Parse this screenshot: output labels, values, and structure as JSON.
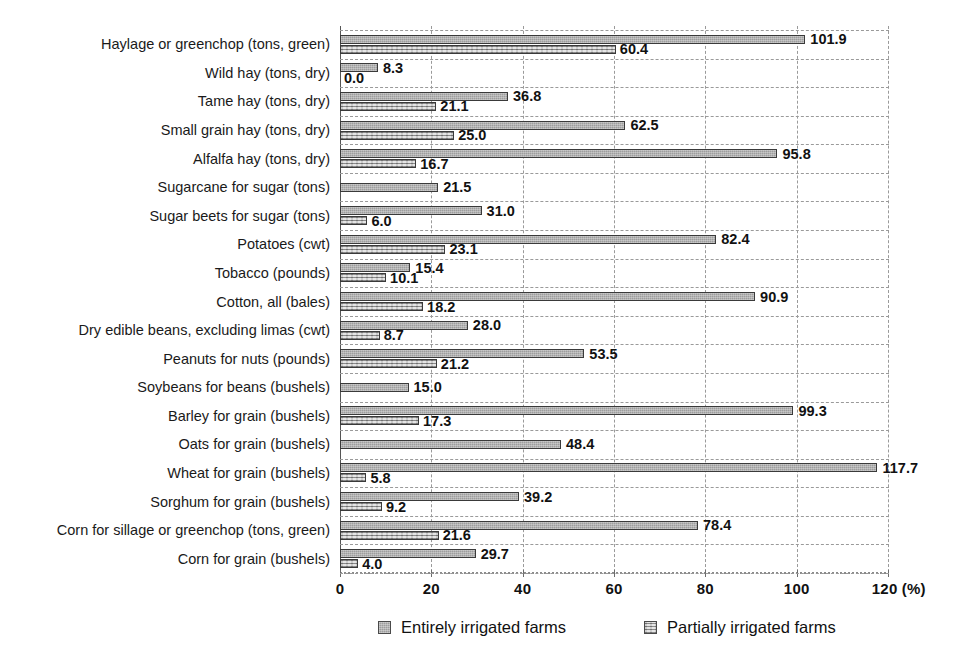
{
  "chart_data": {
    "type": "bar",
    "orientation": "horizontal",
    "title": "",
    "subtitle": "",
    "xlabel": "(%)",
    "ylabel": "",
    "xlim": [
      0,
      120
    ],
    "xticks": [
      0,
      20,
      40,
      60,
      80,
      100,
      120
    ],
    "xtick_labels": [
      "0",
      "20",
      "40",
      "60",
      "80",
      "100",
      "120"
    ],
    "x_unit_label": "120 (%)",
    "grid": "vertical-dashed-and-horizontal-dashed",
    "legend_position": "bottom",
    "legend": [
      "Entirely irrigated farms",
      "Partially irrigated farms"
    ],
    "colors": {
      "entirely": "#9d9d9d",
      "partially": "#b3b3b3",
      "bar_border": "#3a3a3a",
      "grid": "#9a9a9a",
      "axis": "#555555",
      "text": "#111111",
      "background": "#ffffff"
    },
    "categories": [
      "Haylage or greenchop (tons, green)",
      "Wild hay (tons, dry)",
      "Tame hay (tons, dry)",
      "Small grain hay (tons, dry)",
      "Alfalfa hay (tons, dry)",
      "Sugarcane for sugar (tons)",
      "Sugar beets for sugar (tons)",
      "Potatoes (cwt)",
      "Tobacco (pounds)",
      "Cotton, all (bales)",
      "Dry edible beans, excluding limas (cwt)",
      "Peanuts for nuts (pounds)",
      "Soybeans for beans (bushels)",
      "Barley for grain (bushels)",
      "Oats for grain (bushels)",
      "Wheat for grain (bushels)",
      "Sorghum for grain (bushels)",
      "Corn for sillage or greenchop (tons, green)",
      "Corn for grain (bushels)"
    ],
    "series": [
      {
        "name": "Entirely irrigated farms",
        "values": [
          101.9,
          8.3,
          36.8,
          62.5,
          95.8,
          21.5,
          31.0,
          82.4,
          15.4,
          90.9,
          28.0,
          53.5,
          15.0,
          99.3,
          48.4,
          117.7,
          39.2,
          78.4,
          29.7
        ],
        "labels": [
          "101.9",
          "8.3",
          "36.8",
          "62.5",
          "95.8",
          "21.5",
          "31.0",
          "82.4",
          "15.4",
          "90.9",
          "28.0",
          "53.5",
          "15.0",
          "99.3",
          "48.4",
          "117.7",
          "39.2",
          "78.4",
          "29.7"
        ]
      },
      {
        "name": "Partially irrigated farms",
        "values": [
          60.4,
          0.0,
          21.1,
          25.0,
          16.7,
          null,
          6.0,
          23.1,
          10.1,
          18.2,
          8.7,
          21.2,
          null,
          17.3,
          null,
          5.8,
          9.2,
          21.6,
          4.0
        ],
        "labels": [
          "60.4",
          "0.0",
          "21.1",
          "25.0",
          "16.7",
          "",
          "6.0",
          "23.1",
          "10.1",
          "18.2",
          "8.7",
          "21.2",
          "",
          "17.3",
          "",
          "5.8",
          "9.2",
          "21.6",
          "4.0"
        ]
      }
    ]
  },
  "legend": {
    "entirely_label": "Entirely irrigated farms",
    "partially_label": "Partially irrigated farms"
  },
  "axis": {
    "unit": "(%)"
  }
}
